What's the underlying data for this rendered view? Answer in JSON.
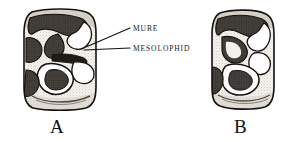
{
  "figure": {
    "background_color": "#ffffff",
    "ink_color": "#1a1a1a",
    "enamel_fill": "#f2efe9",
    "dentine_shadow": "#3a3632",
    "specimens": [
      {
        "letter": "A",
        "name": "molar-occlusal-view-a",
        "x": 22,
        "y": 8,
        "width": 76,
        "height": 104,
        "letter_x": 50,
        "letter_y": 117
      },
      {
        "letter": "B",
        "name": "molar-occlusal-view-b",
        "x": 210,
        "y": 9,
        "width": 66,
        "height": 102,
        "letter_x": 234,
        "letter_y": 117
      }
    ],
    "annotations": [
      {
        "id": "mure",
        "label": "MURE",
        "label_x": 133,
        "label_y": 25,
        "leader": {
          "x1": 130,
          "y1": 28,
          "x2": 86,
          "y2": 47
        }
      },
      {
        "id": "mesolophid",
        "label": "MESOLOPHID",
        "label_x": 133,
        "label_y": 45,
        "leader": {
          "x1": 130,
          "y1": 48,
          "x2": 84,
          "y2": 50
        }
      }
    ]
  }
}
